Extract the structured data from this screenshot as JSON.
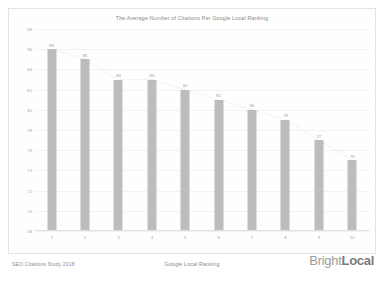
{
  "chart_data": {
    "type": "bar",
    "title": "The Average Number of Citations Per Google Local Ranking",
    "xlabel": "Google Local Ranking",
    "ylabel": "",
    "categories": [
      "1",
      "2",
      "3",
      "4",
      "5",
      "6",
      "7",
      "8",
      "9",
      "10"
    ],
    "values": [
      86,
      85,
      83,
      83,
      82,
      81,
      80,
      79,
      77,
      75
    ],
    "ylim": [
      68,
      88
    ],
    "yticks": [
      88,
      86,
      84,
      82,
      80,
      78,
      76,
      74,
      72,
      70,
      68
    ],
    "grid": true,
    "legend": "none",
    "bar_color": "#bcbcbc",
    "trendline": {
      "visible": true,
      "color": "#d8d8d8",
      "style": "dotted"
    }
  },
  "footer": {
    "source_note": "SEO Citations Study 2018",
    "brand": {
      "light": "Bright",
      "bold": "Local"
    }
  }
}
